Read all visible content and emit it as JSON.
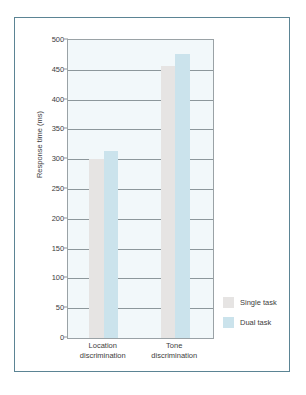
{
  "chart_data": {
    "type": "bar",
    "title": "",
    "xlabel": "",
    "ylabel": "Response time (ms)",
    "ylim": [
      0,
      500
    ],
    "ytick_step": 50,
    "yticks": [
      500,
      450,
      400,
      350,
      300,
      250,
      200,
      150,
      100,
      50,
      0
    ],
    "ytick_labels": [
      "500",
      "450",
      "400",
      "350",
      "300",
      "250",
      "200",
      "150",
      "100",
      "50",
      "0"
    ],
    "grid": true,
    "grid_axis": "y",
    "legend_position": "right-bottom-outside",
    "categories": [
      "Location discrimination",
      "Tone discrimination"
    ],
    "category_lines": [
      [
        "Location",
        "discrimination"
      ],
      [
        "Tone",
        "discrimination"
      ]
    ],
    "series": [
      {
        "name": "Single task",
        "color": "#e6e4e3",
        "values": [
          301,
          457
        ]
      },
      {
        "name": "Dual task",
        "color": "#cbe3ec",
        "values": [
          313,
          477
        ]
      }
    ],
    "plot_background": "#f2f8fa",
    "frame_color": "#5b8494",
    "axis_color": "#8d979b",
    "text_color": "#3d3d3d"
  },
  "legend": {
    "items": [
      {
        "label": "Single task",
        "swatch": "legend-swatch-single-task"
      },
      {
        "label": "Dual task",
        "swatch": "legend-swatch-dual-task"
      }
    ]
  },
  "axis": {
    "y_title": "Response time (ms)"
  }
}
